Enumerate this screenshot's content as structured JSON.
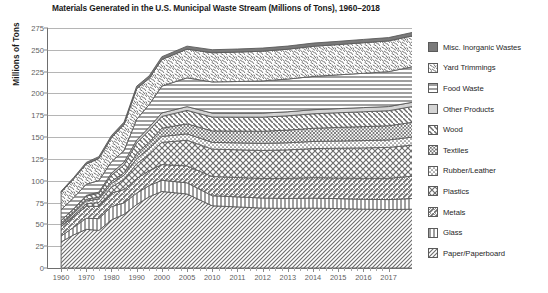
{
  "chart_data": {
    "type": "area",
    "title": "Materials Generated in the U.S. Municipal Waste Stream (Millions of Tons), 1960–2018",
    "xlabel": "",
    "ylabel": "Millions of Tons",
    "ylim": [
      0,
      275
    ],
    "ytick_step": 25,
    "yticks": [
      "0",
      "25",
      "50",
      "75",
      "100",
      "125",
      "150",
      "175",
      "200",
      "225",
      "250",
      "275"
    ],
    "grid": true,
    "legend_position": "right",
    "stacked": true,
    "x": [
      1960,
      1965,
      1970,
      1975,
      1980,
      1985,
      1990,
      1995,
      2000,
      2005,
      2010,
      2011,
      2012,
      2013,
      2014,
      2015,
      2016,
      2017,
      2018
    ],
    "xtick_labels": [
      "1960",
      "1970",
      "1980",
      "1990",
      "2000",
      "2005",
      "2010",
      "2011",
      "2012",
      "2013",
      "2014",
      "2015",
      "2016",
      "2017"
    ],
    "xtick_values": [
      1960,
      1970,
      1980,
      1990,
      2000,
      2005,
      2010,
      2011,
      2012,
      2013,
      2014,
      2015,
      2016,
      2017
    ],
    "series": [
      {
        "name": "Paper/Paperboard",
        "pattern": "diagonal-hatch-dense",
        "values": [
          29.9,
          38.0,
          44.3,
          43.1,
          55.2,
          61.5,
          72.7,
          81.7,
          87.7,
          84.8,
          71.3,
          70.0,
          68.6,
          68.3,
          68.6,
          68.1,
          67.4,
          67.0,
          67.4
        ]
      },
      {
        "name": "Glass",
        "pattern": "vertical-lines",
        "values": [
          6.7,
          8.7,
          12.7,
          13.5,
          15.1,
          13.2,
          13.1,
          12.8,
          12.8,
          12.8,
          11.5,
          11.5,
          11.6,
          11.5,
          11.5,
          11.4,
          11.4,
          11.4,
          12.3
        ]
      },
      {
        "name": "Metals",
        "pattern": "diagonal-slash",
        "values": [
          10.8,
          12.3,
          13.8,
          14.0,
          15.5,
          15.3,
          16.6,
          17.1,
          18.0,
          19.4,
          22.0,
          22.2,
          22.5,
          23.0,
          23.4,
          23.6,
          24.0,
          24.4,
          25.6
        ]
      },
      {
        "name": "Plastics",
        "pattern": "x-crosshatch",
        "values": [
          0.4,
          1.4,
          2.9,
          4.5,
          6.8,
          11.6,
          17.1,
          18.9,
          25.5,
          29.4,
          31.4,
          31.8,
          32.0,
          32.6,
          33.3,
          34.1,
          34.8,
          35.4,
          35.7
        ]
      },
      {
        "name": "Rubber/Leather",
        "pattern": "dotted",
        "values": [
          1.8,
          2.1,
          3.0,
          4.0,
          4.2,
          4.7,
          5.8,
          6.3,
          6.7,
          7.3,
          7.8,
          7.9,
          8.0,
          8.1,
          8.2,
          8.3,
          8.4,
          8.5,
          9.2
        ]
      },
      {
        "name": "Textiles",
        "pattern": "fine-crosshatch",
        "values": [
          1.8,
          2.0,
          2.0,
          2.2,
          2.5,
          2.8,
          5.8,
          7.4,
          9.5,
          11.5,
          13.1,
          13.5,
          14.0,
          14.5,
          15.1,
          15.6,
          16.0,
          16.3,
          17.0
        ]
      },
      {
        "name": "Wood",
        "pattern": "backslash-diagonal",
        "values": [
          3.0,
          3.2,
          3.7,
          4.3,
          7.0,
          9.0,
          12.2,
          13.7,
          13.5,
          15.4,
          15.9,
          16.0,
          16.2,
          16.4,
          16.6,
          16.8,
          17.0,
          17.2,
          18.1
        ]
      },
      {
        "name": "Other Products",
        "pattern": "solid-light-gray",
        "values": [
          0.1,
          0.3,
          0.8,
          1.4,
          2.5,
          3.2,
          3.2,
          3.6,
          4.0,
          4.3,
          4.5,
          4.5,
          4.6,
          4.6,
          4.7,
          4.7,
          4.8,
          4.8,
          4.9
        ]
      },
      {
        "name": "Food Waste",
        "pattern": "horizontal-lines",
        "values": [
          12.2,
          12.6,
          12.8,
          13.2,
          13.0,
          13.2,
          23.9,
          26.0,
          30.7,
          33.0,
          35.7,
          36.3,
          36.9,
          37.5,
          38.1,
          38.7,
          39.3,
          40.0,
          40.7
        ]
      },
      {
        "name": "Yard Trimmings",
        "pattern": "speckled",
        "values": [
          20.0,
          21.6,
          23.2,
          25.2,
          27.5,
          30.0,
          35.0,
          29.8,
          30.5,
          32.9,
          33.4,
          33.7,
          34.0,
          34.2,
          34.5,
          34.7,
          35.0,
          35.2,
          35.4
        ]
      },
      {
        "name": "Misc. Inorganic Wastes",
        "pattern": "solid-dark-gray",
        "values": [
          1.3,
          1.5,
          1.8,
          2.2,
          2.5,
          2.7,
          2.9,
          3.0,
          3.2,
          3.4,
          3.5,
          3.5,
          3.6,
          3.6,
          3.7,
          3.7,
          3.8,
          3.8,
          4.0
        ]
      }
    ],
    "legend": [
      {
        "label": "Misc. Inorganic Wastes",
        "pattern": "solid-dark-gray"
      },
      {
        "label": "Yard Trimmings",
        "pattern": "speckled"
      },
      {
        "label": "Food Waste",
        "pattern": "horizontal-lines"
      },
      {
        "label": "Other Products",
        "pattern": "solid-light-gray"
      },
      {
        "label": "Wood",
        "pattern": "backslash-diagonal"
      },
      {
        "label": "Textiles",
        "pattern": "fine-crosshatch"
      },
      {
        "label": "Rubber/Leather",
        "pattern": "dotted"
      },
      {
        "label": "Plastics",
        "pattern": "x-crosshatch"
      },
      {
        "label": "Metals",
        "pattern": "diagonal-slash"
      },
      {
        "label": "Glass",
        "pattern": "vertical-lines"
      },
      {
        "label": "Paper/Paperboard",
        "pattern": "diagonal-hatch-dense"
      }
    ],
    "colors": {
      "axis": "#6e6e6e",
      "grid": "#b5b5b5",
      "tick_text": "#5e5e5e",
      "title_text": "#1a1a1a",
      "dark_gray": "#7a7a7a",
      "light_gray": "#d4d4d4",
      "pattern_stroke": "#6b6b6b"
    }
  }
}
